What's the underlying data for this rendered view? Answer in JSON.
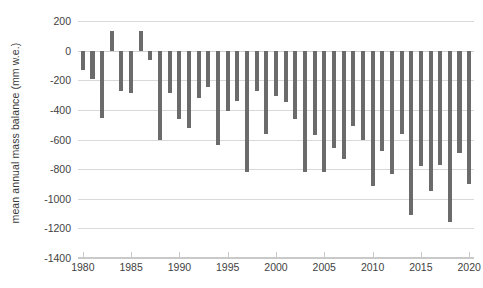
{
  "chart_data": {
    "type": "bar",
    "title": "",
    "subtitle": "",
    "xlabel": "",
    "ylabel": "mean annual mass balance (mm w.e.)",
    "ylim": [
      -1400,
      200
    ],
    "xlim": [
      1979.5,
      2020.5
    ],
    "y_ticks": [
      200,
      0,
      -200,
      -400,
      -600,
      -800,
      -1000,
      -1200,
      -1400
    ],
    "y_tick_labels": [
      "200",
      "0",
      "-200",
      "-400",
      "-600",
      "-800",
      "-1000",
      "-1200",
      "-1400"
    ],
    "x_ticks": [
      1980,
      1985,
      1990,
      1995,
      2000,
      2005,
      2010,
      2015,
      2020
    ],
    "x_tick_labels": [
      "1980",
      "1985",
      "1990",
      "1995",
      "2000",
      "2005",
      "2010",
      "2015",
      "2020"
    ],
    "grid": true,
    "grid_axis": "y",
    "legend": false,
    "bar_color": "#6b6b6b",
    "grid_color": "#d9d9d9",
    "axis_text_color": "#3f3f3f",
    "background_color": "#ffffff",
    "categories": [
      1980,
      1981,
      1982,
      1983,
      1984,
      1985,
      1986,
      1987,
      1988,
      1989,
      1990,
      1991,
      1992,
      1993,
      1994,
      1995,
      1996,
      1997,
      1998,
      1999,
      2000,
      2001,
      2002,
      2003,
      2004,
      2005,
      2006,
      2007,
      2008,
      2009,
      2010,
      2011,
      2012,
      2013,
      2014,
      2015,
      2016,
      2017,
      2018,
      2019,
      2020
    ],
    "values": [
      -130,
      -190,
      -455,
      130,
      -275,
      -285,
      130,
      -60,
      -600,
      -285,
      -460,
      -520,
      -320,
      -245,
      -640,
      -410,
      -340,
      -820,
      -270,
      -560,
      -305,
      -350,
      -460,
      -820,
      -570,
      -820,
      -660,
      -730,
      -510,
      -600,
      -915,
      -680,
      -830,
      -560,
      -1110,
      -780,
      -950,
      -770,
      -1160,
      -690,
      -900
    ]
  }
}
